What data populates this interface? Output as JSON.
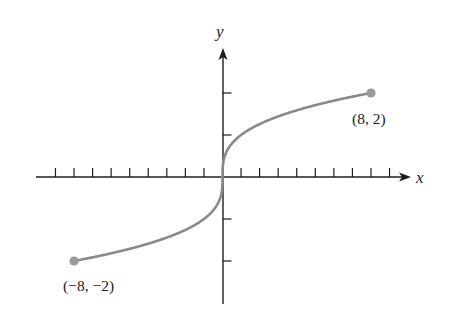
{
  "chart_data": {
    "type": "line",
    "title": "",
    "function": "y = cube root of x",
    "xlabel": "x",
    "ylabel": "y",
    "xlim": [
      -10,
      10
    ],
    "ylim": [
      -3,
      3
    ],
    "grid": false,
    "legend": null,
    "x_ticks": [
      -9,
      -8,
      -7,
      -6,
      -5,
      -4,
      -3,
      -2,
      -1,
      1,
      2,
      3,
      4,
      5,
      6,
      7,
      8,
      9
    ],
    "y_ticks": [
      -2,
      -1,
      1,
      2
    ],
    "tick_labels_shown": false,
    "series": [
      {
        "name": "cube root",
        "x": [
          -8,
          -6,
          -4,
          -2,
          -1,
          -0.5,
          -0.125,
          0,
          0.125,
          0.5,
          1,
          2,
          4,
          6,
          8
        ],
        "y": [
          -2,
          -1.817,
          -1.587,
          -1.26,
          -1,
          -0.794,
          -0.5,
          0,
          0.5,
          0.794,
          1,
          1.26,
          1.587,
          1.817,
          2
        ],
        "color": "#8a8a8a"
      }
    ],
    "annotations": [
      {
        "text": "(8, 2)",
        "x": 8,
        "y": 2,
        "marker": "closed-dot"
      },
      {
        "text": "(−8, −2)",
        "x": -8,
        "y": -2,
        "marker": "closed-dot"
      }
    ]
  },
  "labels": {
    "x_axis": "x",
    "y_axis": "y",
    "point_right": "(8, 2)",
    "point_left": "(−8, −2)"
  },
  "colors": {
    "axis": "#1e1e1e",
    "curve": "#8a8a8a",
    "endpoint": "#9a9a9a"
  }
}
